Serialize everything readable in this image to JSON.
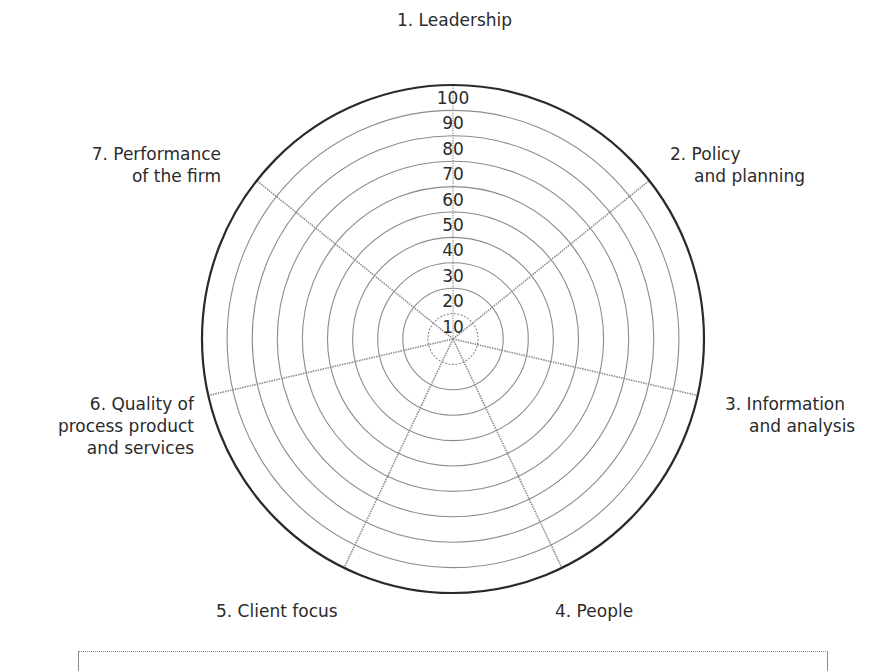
{
  "chart_data": {
    "type": "radar",
    "title": "",
    "axes": [
      {
        "id": 1,
        "label_lines": [
          "1. Leadership"
        ]
      },
      {
        "id": 2,
        "label_lines": [
          "2. Policy",
          "and planning"
        ]
      },
      {
        "id": 3,
        "label_lines": [
          "3. Information",
          "and analysis"
        ]
      },
      {
        "id": 4,
        "label_lines": [
          "4. People"
        ]
      },
      {
        "id": 5,
        "label_lines": [
          "5. Client focus"
        ]
      },
      {
        "id": 6,
        "label_lines": [
          "6. Quality of",
          "process product",
          "and services"
        ]
      },
      {
        "id": 7,
        "label_lines": [
          "7. Performance",
          "of the firm"
        ]
      }
    ],
    "categories": [
      "1. Leadership",
      "2. Policy and planning",
      "3. Information and analysis",
      "4. People",
      "5. Client focus",
      "6. Quality of process product and services",
      "7. Performance of the firm"
    ],
    "radial_ticks": [
      10,
      20,
      30,
      40,
      50,
      60,
      70,
      80,
      90,
      100
    ],
    "rlim": [
      0,
      100
    ],
    "series": [],
    "grid": true,
    "legend": null
  },
  "style": {
    "outer_ring_color": "#2a2a2a",
    "ring_color": "#8c8c8c",
    "spoke_color": "#8c8c8c",
    "text_color": "#2b2b2b"
  }
}
